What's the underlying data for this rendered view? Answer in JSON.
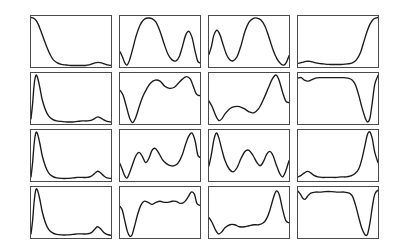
{
  "figure": {
    "background_color": "#ffffff",
    "panel_border_color": "#4a4a4a",
    "curve_color": "#1a1a1a",
    "rows": 4,
    "columns": 4,
    "panel_width": 82,
    "panel_height": 53,
    "grid_origin_x": 30,
    "grid_origin_y": 15,
    "column_step": 89,
    "row_step": 57
  },
  "chart_data": {
    "type": "line",
    "title": "",
    "subtitle": "",
    "xlabel": "",
    "ylabel": "",
    "grid": false,
    "legend": "none",
    "axis_ticks": "none",
    "layout": {
      "rows": 4,
      "columns": 4,
      "panels": 16
    },
    "xlim": [
      0,
      100
    ],
    "ylim": [
      0,
      100
    ],
    "panels": [
      {
        "id": "panel-r1c1",
        "row": 1,
        "column": 1,
        "description": "sharp decay from top-left to near-zero baseline with small late bump",
        "x": [
          0,
          3,
          6,
          9,
          12,
          16,
          20,
          24,
          28,
          33,
          38,
          44,
          50,
          56,
          62,
          68,
          72,
          76,
          80,
          84,
          88,
          92,
          96,
          100
        ],
        "y": [
          97,
          96,
          92,
          84,
          72,
          55,
          38,
          24,
          14,
          8,
          5,
          4,
          3,
          3,
          3,
          3,
          4,
          6,
          8,
          9,
          8,
          6,
          4,
          3
        ]
      },
      {
        "id": "panel-r1c2",
        "row": 1,
        "column": 2,
        "description": "dip at left, broad tall plateau, deep valley, secondary peak, drop at right",
        "x": [
          0,
          3,
          6,
          9,
          12,
          16,
          20,
          25,
          30,
          35,
          40,
          45,
          50,
          55,
          60,
          65,
          70,
          74,
          78,
          82,
          86,
          90,
          94,
          97,
          100
        ],
        "y": [
          30,
          20,
          8,
          4,
          14,
          36,
          60,
          82,
          93,
          96,
          95,
          88,
          70,
          46,
          25,
          14,
          12,
          20,
          40,
          62,
          70,
          58,
          30,
          12,
          8
        ]
      },
      {
        "id": "panel-r1c3",
        "row": 1,
        "column": 3,
        "description": "narrow left peak, valley, broad tall central plateau, steep fall to dip at right edge",
        "x": [
          0,
          3,
          6,
          10,
          14,
          18,
          22,
          26,
          30,
          35,
          40,
          45,
          50,
          55,
          60,
          65,
          70,
          75,
          80,
          85,
          90,
          94,
          97,
          100
        ],
        "y": [
          25,
          40,
          62,
          72,
          62,
          42,
          24,
          14,
          12,
          20,
          42,
          70,
          88,
          95,
          96,
          92,
          80,
          58,
          34,
          16,
          6,
          4,
          10,
          22
        ]
      },
      {
        "id": "panel-r1c4",
        "row": 1,
        "column": 4,
        "description": "flat low baseline with shallow bump then steep rise to top-right corner",
        "x": [
          0,
          5,
          10,
          15,
          20,
          26,
          32,
          38,
          44,
          50,
          56,
          62,
          68,
          73,
          78,
          82,
          86,
          90,
          94,
          97,
          100
        ],
        "y": [
          7,
          9,
          11,
          11,
          9,
          7,
          6,
          5,
          5,
          5,
          5,
          6,
          8,
          14,
          28,
          48,
          68,
          84,
          93,
          96,
          97
        ]
      },
      {
        "id": "panel-r2c1",
        "row": 2,
        "column": 1,
        "description": "very narrow tall spike near left edge decaying to flat baseline with small late bump",
        "x": [
          0,
          2,
          4,
          6,
          8,
          11,
          14,
          18,
          22,
          27,
          32,
          38,
          45,
          52,
          58,
          64,
          70,
          75,
          79,
          83,
          87,
          91,
          95,
          100
        ],
        "y": [
          10,
          40,
          78,
          95,
          92,
          72,
          48,
          28,
          16,
          9,
          6,
          5,
          4,
          4,
          5,
          6,
          6,
          7,
          10,
          14,
          12,
          8,
          5,
          4
        ]
      },
      {
        "id": "panel-r2c2",
        "row": 2,
        "column": 2,
        "description": "high at left, deep narrow valley to floor, climb to rounded plateau, dip, tall right peak, drop",
        "x": [
          0,
          4,
          8,
          12,
          16,
          20,
          24,
          28,
          33,
          38,
          44,
          50,
          56,
          62,
          68,
          73,
          78,
          83,
          88,
          92,
          95,
          98,
          100
        ],
        "y": [
          66,
          56,
          34,
          12,
          3,
          14,
          34,
          52,
          68,
          80,
          86,
          84,
          74,
          70,
          72,
          80,
          88,
          93,
          88,
          72,
          60,
          56,
          56
        ]
      },
      {
        "id": "panel-r2c3",
        "row": 2,
        "column": 3,
        "description": "moderate left, dip to floor, broad low hump, steep rise to tall right peak then drop",
        "x": [
          0,
          4,
          8,
          12,
          16,
          20,
          26,
          32,
          38,
          44,
          50,
          56,
          62,
          68,
          74,
          79,
          84,
          88,
          92,
          96,
          100
        ],
        "y": [
          45,
          34,
          18,
          7,
          10,
          20,
          30,
          34,
          34,
          30,
          24,
          22,
          30,
          48,
          70,
          88,
          96,
          84,
          62,
          45,
          42
        ]
      },
      {
        "id": "panel-r2c4",
        "row": 2,
        "column": 4,
        "description": "high plateau across most of panel with small dip, then deep narrow valley and spike to top-right",
        "x": [
          0,
          4,
          8,
          12,
          16,
          22,
          28,
          34,
          40,
          48,
          56,
          62,
          68,
          72,
          76,
          80,
          84,
          87,
          90,
          93,
          96,
          100
        ],
        "y": [
          90,
          91,
          86,
          84,
          86,
          90,
          91,
          91,
          91,
          91,
          91,
          90,
          86,
          76,
          56,
          32,
          12,
          4,
          12,
          44,
          78,
          95
        ]
      },
      {
        "id": "panel-r3c1",
        "row": 3,
        "column": 1,
        "description": "narrow tall spike near left edge, decay to baseline, small bump near right",
        "x": [
          0,
          2,
          4,
          6,
          8,
          11,
          14,
          18,
          22,
          27,
          32,
          38,
          45,
          52,
          58,
          64,
          70,
          75,
          79,
          83,
          87,
          91,
          95,
          100
        ],
        "y": [
          8,
          36,
          74,
          94,
          93,
          74,
          50,
          29,
          16,
          9,
          6,
          5,
          5,
          6,
          7,
          7,
          7,
          9,
          14,
          19,
          16,
          10,
          6,
          5
        ]
      },
      {
        "id": "panel-r3c2",
        "row": 3,
        "column": 2,
        "description": "low at left, dip, three rounded humps of rising height, tall right peak, fall at edge",
        "x": [
          0,
          3,
          6,
          9,
          12,
          16,
          20,
          24,
          28,
          32,
          36,
          40,
          44,
          48,
          53,
          58,
          63,
          68,
          73,
          78,
          82,
          86,
          90,
          94,
          97,
          100
        ],
        "y": [
          34,
          22,
          10,
          6,
          16,
          34,
          50,
          56,
          48,
          36,
          44,
          60,
          64,
          56,
          42,
          34,
          30,
          30,
          36,
          52,
          72,
          88,
          94,
          78,
          52,
          46
        ]
      },
      {
        "id": "panel-r3c3",
        "row": 3,
        "column": 3,
        "description": "tall narrow left peak, valley, medium hump, dip, smaller hump, deep dip then rise at right edge",
        "x": [
          0,
          3,
          6,
          9,
          12,
          16,
          20,
          25,
          30,
          35,
          40,
          45,
          50,
          55,
          60,
          64,
          68,
          72,
          76,
          80,
          84,
          88,
          92,
          96,
          100
        ],
        "y": [
          30,
          52,
          80,
          94,
          86,
          62,
          40,
          24,
          18,
          26,
          44,
          58,
          60,
          50,
          36,
          30,
          38,
          52,
          58,
          50,
          32,
          16,
          8,
          20,
          40
        ]
      },
      {
        "id": "panel-r3c4",
        "row": 3,
        "column": 4,
        "description": "low baseline with small early bump, flat, then very tall narrow spike near right edge",
        "x": [
          0,
          4,
          8,
          12,
          16,
          20,
          25,
          30,
          36,
          42,
          48,
          54,
          60,
          66,
          71,
          76,
          80,
          84,
          87,
          90,
          93,
          96,
          100
        ],
        "y": [
          8,
          11,
          16,
          19,
          16,
          11,
          8,
          7,
          7,
          7,
          7,
          8,
          8,
          10,
          14,
          24,
          44,
          72,
          92,
          96,
          82,
          56,
          36
        ]
      },
      {
        "id": "panel-r4c1",
        "row": 4,
        "column": 1,
        "description": "narrow tall spike near left edge, decay to baseline, small bump near right",
        "x": [
          0,
          2,
          4,
          6,
          8,
          11,
          14,
          18,
          22,
          27,
          32,
          38,
          45,
          52,
          58,
          64,
          70,
          75,
          79,
          83,
          87,
          91,
          95,
          100
        ],
        "y": [
          8,
          34,
          72,
          94,
          94,
          76,
          52,
          30,
          17,
          10,
          7,
          6,
          6,
          7,
          8,
          8,
          8,
          10,
          16,
          22,
          18,
          11,
          7,
          5
        ]
      },
      {
        "id": "panel-r4c2",
        "row": 4,
        "column": 2,
        "description": "high at left, very deep narrow valley to floor, rise to wavy plateau, peak at right then drop",
        "x": [
          0,
          3,
          6,
          9,
          12,
          15,
          18,
          22,
          26,
          30,
          35,
          40,
          45,
          50,
          55,
          60,
          65,
          70,
          75,
          80,
          85,
          89,
          93,
          96,
          100
        ],
        "y": [
          62,
          54,
          34,
          14,
          4,
          6,
          22,
          46,
          64,
          72,
          70,
          66,
          70,
          72,
          70,
          70,
          72,
          72,
          68,
          70,
          80,
          90,
          86,
          68,
          64
        ]
      },
      {
        "id": "panel-r4c3",
        "row": 4,
        "column": 3,
        "description": "moderate left, dip to floor, long low wavy region, steep rise to tall right peak then fall",
        "x": [
          0,
          4,
          8,
          12,
          16,
          20,
          26,
          32,
          38,
          44,
          50,
          56,
          62,
          68,
          72,
          76,
          80,
          84,
          88,
          92,
          96,
          100
        ],
        "y": [
          40,
          30,
          16,
          8,
          12,
          20,
          26,
          26,
          22,
          22,
          24,
          26,
          26,
          30,
          38,
          54,
          76,
          92,
          84,
          56,
          34,
          30
        ]
      },
      {
        "id": "panel-r4c4",
        "row": 4,
        "column": 4,
        "description": "small dip at left then high plateau, deep narrow valley near right, spike back to top-right",
        "x": [
          0,
          3,
          6,
          9,
          12,
          16,
          22,
          28,
          34,
          42,
          50,
          58,
          64,
          68,
          72,
          76,
          80,
          84,
          87,
          90,
          93,
          96,
          100
        ],
        "y": [
          92,
          86,
          78,
          76,
          82,
          88,
          90,
          90,
          91,
          91,
          90,
          90,
          88,
          82,
          64,
          40,
          18,
          6,
          8,
          30,
          62,
          86,
          94
        ]
      }
    ]
  }
}
